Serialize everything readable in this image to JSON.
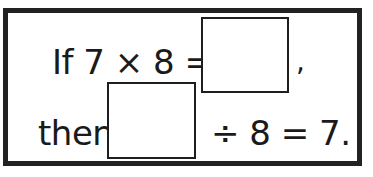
{
  "problem": {
    "line1": {
      "prefix": "If 7 × 8 =",
      "suffix": ","
    },
    "line2": {
      "prefix": "then",
      "suffix": "÷ 8 = 7."
    },
    "answer_box_1": "",
    "answer_box_2": ""
  },
  "colors": {
    "border": "#222222",
    "text": "#1a1a1a",
    "background": "#ffffff"
  }
}
